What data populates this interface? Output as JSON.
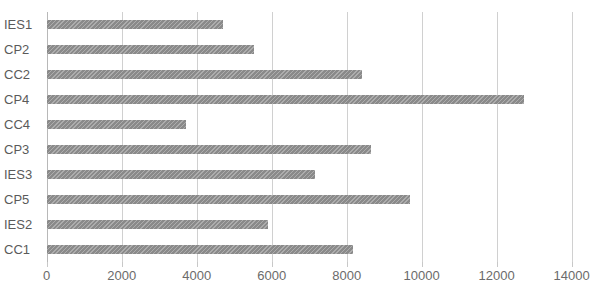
{
  "chart_data": {
    "type": "bar",
    "orientation": "horizontal",
    "title": "",
    "xlabel": "",
    "ylabel": "",
    "categories": [
      "IES1",
      "CP2",
      "CC2",
      "CP4",
      "CC4",
      "CP3",
      "IES3",
      "CP5",
      "IES2",
      "CC1"
    ],
    "values": [
      4700,
      5530,
      8420,
      12740,
      3720,
      8640,
      7150,
      9690,
      5910,
      8180
    ],
    "series": [
      {
        "name": "",
        "values": [
          4700,
          5530,
          8420,
          12740,
          3720,
          8640,
          7150,
          9690,
          5910,
          8180
        ]
      }
    ],
    "xlim": [
      0,
      14000
    ],
    "xticks": [
      0,
      2000,
      4000,
      6000,
      8000,
      10000,
      12000,
      14000
    ],
    "xtick_labels": [
      "0",
      "2000",
      "4000",
      "6000",
      "8000",
      "10000",
      "12000",
      "14000"
    ],
    "grid": true,
    "grid_axis": "x",
    "legend": false,
    "legend_position": "none",
    "bar_color": "#8a8a8a",
    "grid_color": "#d0d0d0",
    "text_color": "#5a5a5a"
  }
}
